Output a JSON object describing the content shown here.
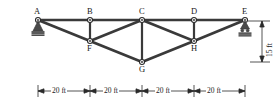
{
  "figure": {
    "type": "structural-truss-diagram",
    "units": "ft",
    "stroke_color": "#3a3a3a",
    "label_color": "#1a1a1a",
    "background": "#ffffff"
  },
  "joints": [
    {
      "id": "A",
      "label": "A",
      "x": 38,
      "y": 20,
      "label_dx": -4,
      "label_dy": -11,
      "support": "pin"
    },
    {
      "id": "B",
      "label": "B",
      "x": 90,
      "y": 20,
      "label_dx": -3,
      "label_dy": -11,
      "support": "none"
    },
    {
      "id": "C",
      "label": "C",
      "x": 142,
      "y": 20,
      "label_dx": -3,
      "label_dy": -11,
      "support": "none"
    },
    {
      "id": "D",
      "label": "D",
      "x": 194,
      "y": 20,
      "label_dx": -3,
      "label_dy": -11,
      "support": "none"
    },
    {
      "id": "E",
      "label": "E",
      "x": 245,
      "y": 20,
      "label_dx": -3,
      "label_dy": -11,
      "support": "roller"
    },
    {
      "id": "F",
      "label": "F",
      "x": 90,
      "y": 41,
      "label_dx": -3,
      "label_dy": 3,
      "support": "none"
    },
    {
      "id": "G",
      "label": "G",
      "x": 142,
      "y": 62,
      "label_dx": -3,
      "label_dy": 2,
      "support": "none"
    },
    {
      "id": "H",
      "label": "H",
      "x": 194,
      "y": 41,
      "label_dx": -3,
      "label_dy": 3,
      "support": "none"
    }
  ],
  "members": [
    {
      "from": "A",
      "to": "B",
      "chord": "top"
    },
    {
      "from": "B",
      "to": "C",
      "chord": "top"
    },
    {
      "from": "C",
      "to": "D",
      "chord": "top"
    },
    {
      "from": "D",
      "to": "E",
      "chord": "top"
    },
    {
      "from": "A",
      "to": "F",
      "chord": "bottom"
    },
    {
      "from": "F",
      "to": "G",
      "chord": "bottom"
    },
    {
      "from": "G",
      "to": "H",
      "chord": "bottom"
    },
    {
      "from": "H",
      "to": "E",
      "chord": "bottom"
    },
    {
      "from": "B",
      "to": "F",
      "chord": "vertical"
    },
    {
      "from": "C",
      "to": "G",
      "chord": "vertical"
    },
    {
      "from": "D",
      "to": "H",
      "chord": "vertical"
    },
    {
      "from": "C",
      "to": "F",
      "chord": "diagonal"
    },
    {
      "from": "C",
      "to": "H",
      "chord": "diagonal"
    }
  ],
  "supports": {
    "pin": {
      "joint": "A",
      "name": "pin-support"
    },
    "roller": {
      "joint": "E",
      "name": "roller-support"
    }
  },
  "dimensions": {
    "horizontal": {
      "line_y": 91,
      "segments": [
        {
          "label": "20 ft",
          "x_start": 38,
          "x_end": 90
        },
        {
          "label": "20 ft",
          "x_start": 90,
          "x_end": 142
        },
        {
          "label": "20 ft",
          "x_start": 142,
          "x_end": 194
        },
        {
          "label": "20 ft",
          "x_start": 194,
          "x_end": 245
        }
      ]
    },
    "vertical": {
      "label": "15 ft",
      "x": 262,
      "y_top": 21,
      "y_bottom": 62
    }
  }
}
